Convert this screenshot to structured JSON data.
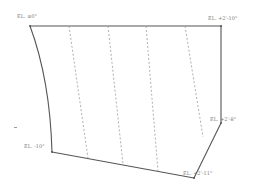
{
  "diagram": {
    "title": "",
    "outline_color": "#555555",
    "dashed_color": "#9a9a9a",
    "labels": [
      {
        "id": "top-left",
        "text": "EL. ±0\"",
        "x": 17,
        "y": 14
      },
      {
        "id": "top-right",
        "text": "EL. +2'-10\"",
        "x": 208,
        "y": 16
      },
      {
        "id": "right-mid",
        "text": "EL. +2'-8\"",
        "x": 210,
        "y": 117
      },
      {
        "id": "bottom-left",
        "text": "EL. -10\"",
        "x": 24,
        "y": 144
      },
      {
        "id": "bottom-right",
        "text": "EL. +2'-11\"",
        "x": 183,
        "y": 171
      }
    ],
    "outline_points": [
      [
        30,
        26
      ],
      [
        221,
        26
      ],
      [
        221,
        123
      ],
      [
        194,
        178
      ],
      [
        52,
        152
      ]
    ],
    "left_edge_curve": {
      "start": [
        52,
        152
      ],
      "control": [
        50,
        80
      ],
      "end": [
        30,
        26
      ]
    },
    "dashed_lines": [
      {
        "from": [
          69,
          26
        ],
        "to": [
          88,
          158
        ]
      },
      {
        "from": [
          108,
          26
        ],
        "to": [
          123,
          164
        ]
      },
      {
        "from": [
          146,
          26
        ],
        "to": [
          158,
          171
        ]
      },
      {
        "from": [
          185,
          26
        ],
        "to": [
          203,
          137
        ]
      }
    ],
    "stray_mark": {
      "x": 14,
      "y": 127
    }
  }
}
